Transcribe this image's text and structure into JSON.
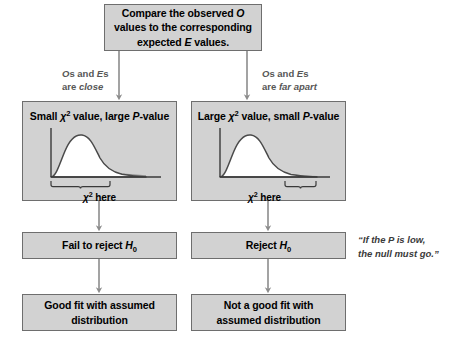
{
  "diagram": {
    "background_color": "#ffffff",
    "box_fill_color": "#d2d2d2",
    "box_border_color": "#6e6e6e",
    "arrow_color": "#8c8c8c",
    "top_box": {
      "line1": "Compare the observed O",
      "line2": "values to the corresponding",
      "line3": "expected E values."
    },
    "branches": {
      "left": {
        "line1": "Os and Es",
        "line2": "are close"
      },
      "right": {
        "line1": "Os and Es",
        "line2": "are far apart"
      }
    },
    "left_chi_box": {
      "title": "Small χ² value, large P-value",
      "bracket_label": "χ² here",
      "bracket_side": "left"
    },
    "right_chi_box": {
      "title": "Large χ² value, small P-value",
      "bracket_label": "χ² here",
      "bracket_side": "right"
    },
    "left_conclusion": "Fail to reject H₀",
    "right_conclusion": "Reject H₀",
    "left_result": {
      "line1": "Good fit with assumed",
      "line2": "distribution"
    },
    "right_result": {
      "line1": "Not a good fit with",
      "line2": "assumed distribution"
    },
    "quote": {
      "line1": "“If the P is low,",
      "line2": "the null must go.”"
    }
  },
  "chart_data": [
    {
      "type": "line",
      "title": "Small chi-square value, large P-value",
      "xlabel": "",
      "ylabel": "",
      "curve": "chi-square density",
      "shaded_tail": "right tail beyond chi-square statistic (large area / large P-value)",
      "bracket_label": "χ² here",
      "bracket_position": "left side of axis, near zero",
      "grid": false,
      "legend": false
    },
    {
      "type": "line",
      "title": "Large chi-square value, small P-value",
      "xlabel": "",
      "ylabel": "",
      "curve": "chi-square density",
      "shaded_tail": "right tail beyond chi-square statistic (small area / small P-value)",
      "bracket_label": "χ² here",
      "bracket_position": "right side of axis, far from zero",
      "grid": false,
      "legend": false
    }
  ]
}
